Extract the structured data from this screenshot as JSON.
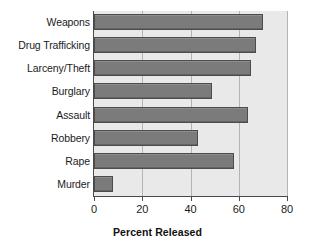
{
  "chart_data": {
    "type": "bar",
    "orientation": "horizontal",
    "title": "",
    "xlabel": "Percent Released",
    "ylabel": "",
    "categories": [
      "Weapons",
      "Drug Trafficking",
      "Larceny/Theft",
      "Burglary",
      "Assault",
      "Robbery",
      "Rape",
      "Murder"
    ],
    "values": [
      70,
      67,
      65,
      49,
      64,
      43,
      58,
      8
    ],
    "xlim": [
      0,
      80
    ],
    "ylim": [
      0,
      8
    ],
    "xticks": [
      0,
      20,
      40,
      60,
      80
    ],
    "xticklabels": [
      "0",
      "20",
      "40",
      "60",
      "80"
    ],
    "grid": true,
    "grid_axis": "x",
    "legend": false,
    "bar_color": "#7b7b7b",
    "bar_edge_color": "#4c4c4c",
    "plot_background": "#e9e9e9",
    "figure_background": "#ffffff",
    "axis_color": "#4a4a4a",
    "gridline_color": "#b4b4b4"
  }
}
